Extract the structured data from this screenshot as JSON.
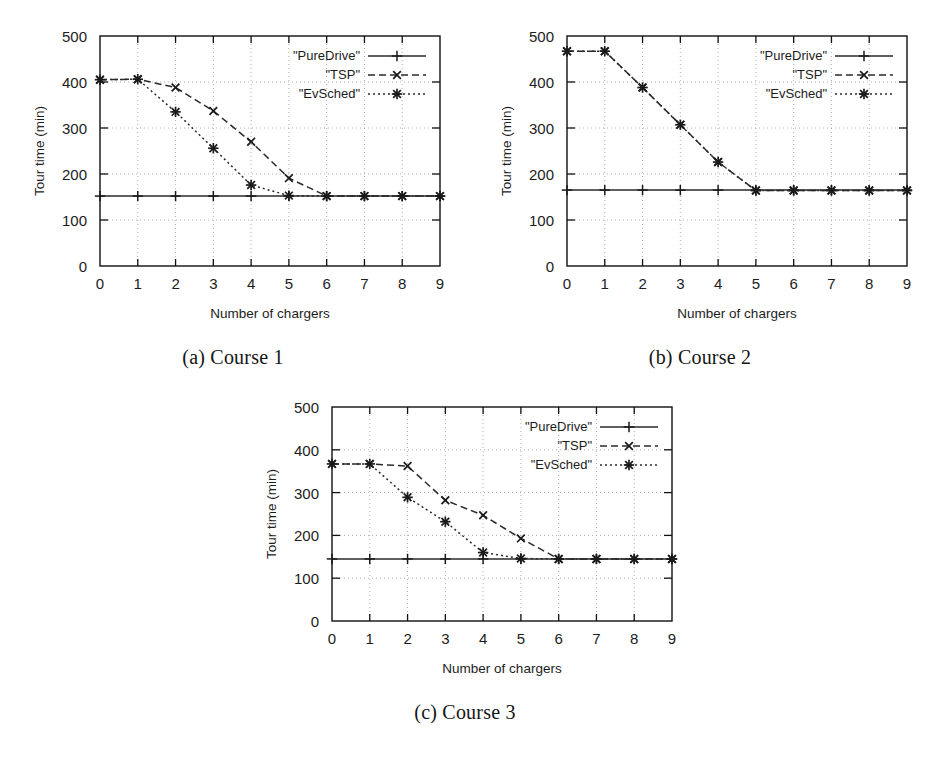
{
  "figure": {
    "panels": [
      {
        "id": "a",
        "caption": "(a) Course 1",
        "xlabel": "Number of chargers",
        "ylabel": "Tour time (min)"
      },
      {
        "id": "b",
        "caption": "(b) Course 2",
        "xlabel": "Number of chargers",
        "ylabel": "Tour time (min)"
      },
      {
        "id": "c",
        "caption": "(c) Course 3",
        "xlabel": "Number of chargers",
        "ylabel": "Tour time (min)"
      }
    ]
  },
  "axis": {
    "xticks": [
      "0",
      "1",
      "2",
      "3",
      "4",
      "5",
      "6",
      "7",
      "8",
      "9"
    ],
    "yticks": [
      "0",
      "100",
      "200",
      "300",
      "400",
      "500"
    ]
  },
  "legend": {
    "puredrive": "\"PureDrive\"",
    "tsp": "\"TSP\"",
    "evsched": "\"EvSched\""
  },
  "style": {
    "ink": "#1a1a1a",
    "grid": "#9a9a9a",
    "paper": "#ffffff"
  },
  "chart_data": [
    {
      "type": "line",
      "title": "(a) Course 1",
      "xlabel": "Number of chargers",
      "ylabel": "Tour time (min)",
      "xlim": [
        0,
        9
      ],
      "ylim": [
        0,
        500
      ],
      "xticks": [
        0,
        1,
        2,
        3,
        4,
        5,
        6,
        7,
        8,
        9
      ],
      "yticks": [
        0,
        100,
        200,
        300,
        400,
        500
      ],
      "grid": true,
      "legend_position": "top-right",
      "x": [
        0,
        1,
        2,
        3,
        4,
        5,
        6,
        7,
        8,
        9
      ],
      "series": [
        {
          "name": "\"PureDrive\"",
          "marker": "plus",
          "dash": "solid",
          "values": [
            152,
            152,
            152,
            152,
            152,
            152,
            152,
            152,
            152,
            152
          ]
        },
        {
          "name": "\"TSP\"",
          "marker": "cross",
          "dash": "dashed",
          "values": [
            405,
            406,
            388,
            337,
            270,
            191,
            152,
            152,
            152,
            152
          ]
        },
        {
          "name": "\"EvSched\"",
          "marker": "asterisk",
          "dash": "dotted",
          "values": [
            405,
            406,
            335,
            256,
            176,
            153,
            152,
            152,
            152,
            152
          ]
        }
      ]
    },
    {
      "type": "line",
      "title": "(b) Course 2",
      "xlabel": "Number of chargers",
      "ylabel": "Tour time (min)",
      "xlim": [
        0,
        9
      ],
      "ylim": [
        0,
        500
      ],
      "xticks": [
        0,
        1,
        2,
        3,
        4,
        5,
        6,
        7,
        8,
        9
      ],
      "yticks": [
        0,
        100,
        200,
        300,
        400,
        500
      ],
      "grid": true,
      "legend_position": "top-right",
      "x": [
        0,
        1,
        2,
        3,
        4,
        5,
        6,
        7,
        8,
        9
      ],
      "series": [
        {
          "name": "\"PureDrive\"",
          "marker": "plus",
          "dash": "solid",
          "values": [
            165,
            165,
            165,
            165,
            165,
            165,
            165,
            165,
            165,
            165
          ]
        },
        {
          "name": "\"TSP\"",
          "marker": "cross",
          "dash": "dashed",
          "values": [
            467,
            467,
            388,
            307,
            226,
            164,
            164,
            164,
            164,
            164
          ]
        },
        {
          "name": "\"EvSched\"",
          "marker": "asterisk",
          "dash": "dotted",
          "values": [
            467,
            467,
            388,
            307,
            226,
            164,
            164,
            164,
            164,
            164
          ]
        }
      ]
    },
    {
      "type": "line",
      "title": "(c) Course 3",
      "xlabel": "Number of chargers",
      "ylabel": "Tour time (min)",
      "xlim": [
        0,
        9
      ],
      "ylim": [
        0,
        500
      ],
      "xticks": [
        0,
        1,
        2,
        3,
        4,
        5,
        6,
        7,
        8,
        9
      ],
      "yticks": [
        0,
        100,
        200,
        300,
        400,
        500
      ],
      "grid": true,
      "legend_position": "top-right",
      "x": [
        0,
        1,
        2,
        3,
        4,
        5,
        6,
        7,
        8,
        9
      ],
      "series": [
        {
          "name": "\"PureDrive\"",
          "marker": "plus",
          "dash": "solid",
          "values": [
            145,
            145,
            145,
            145,
            145,
            145,
            145,
            145,
            145,
            145
          ]
        },
        {
          "name": "\"TSP\"",
          "marker": "cross",
          "dash": "dashed",
          "values": [
            367,
            367,
            362,
            282,
            247,
            193,
            145,
            145,
            145,
            145
          ]
        },
        {
          "name": "\"EvSched\"",
          "marker": "asterisk",
          "dash": "dotted",
          "values": [
            367,
            367,
            289,
            232,
            160,
            146,
            145,
            145,
            145,
            145
          ]
        }
      ]
    }
  ]
}
